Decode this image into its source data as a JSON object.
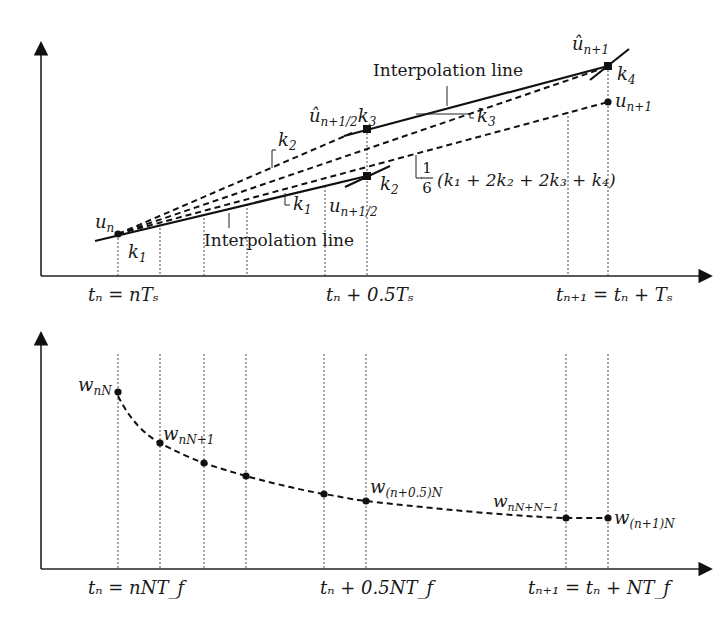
{
  "top_panel": {
    "title": "Runge-Kutta interpolation in one sample period T_s",
    "labels": {
      "interp_line_upper": "Interpolation line",
      "interp_line_lower": "Interpolation line",
      "u_n": "u",
      "u_n_sub": "n",
      "u_hat_half": "û",
      "u_hat_half_sub": "n+1/2",
      "k3_at_half": "k",
      "k3_at_half_sub": "3",
      "u_half": "u",
      "u_half_sub": "n+1/2",
      "u_hat_next": "û",
      "u_hat_next_sub": "n+1",
      "u_next": "u",
      "u_next_sub": "n+1",
      "k1_a": "k",
      "k1_a_sub": "1",
      "k1_b": "k",
      "k1_b_sub": "1",
      "k2_a": "k",
      "k2_a_sub": "2",
      "k2_b": "k",
      "k2_b_sub": "2",
      "k3_b": "k",
      "k3_b_sub": "3",
      "k4": "k",
      "k4_sub": "4",
      "weighted_avg": "(k₁ + 2k₂ + 2k₃ + k₄)",
      "frac_num": "1",
      "frac_den": "6"
    },
    "x_ticks": {
      "t0": "tₙ = nTₛ",
      "t_half": "tₙ + 0.5Tₛ",
      "t1": "tₙ₊₁ = tₙ + Tₛ"
    }
  },
  "bottom_panel": {
    "title": "Fine-step samples within one period",
    "labels": {
      "w_nN": "w",
      "w_nN_sub": "nN",
      "w_nN1": "w",
      "w_nN1_sub": "nN+1",
      "w_half": "w",
      "w_half_sub": "(n+0.5)N",
      "w_last": "w",
      "w_last_sub": "nN+N−1",
      "w_next": "w",
      "w_next_sub": "(n+1)N"
    },
    "x_ticks": {
      "t0": "tₙ = nNT_f",
      "t_half": "tₙ + 0.5NT_f",
      "t1": "tₙ₊₁ = tₙ + NT_f"
    }
  }
}
